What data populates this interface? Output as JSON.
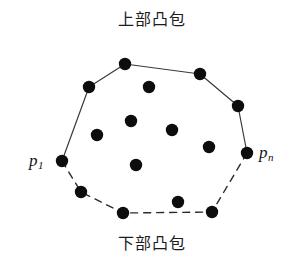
{
  "figure": {
    "title_top": "上部凸包",
    "title_bottom": "下部凸包",
    "label_p1_base": "p",
    "label_p1_sub": "1",
    "label_pn_base": "p",
    "label_pn_sub": "n",
    "colors": {
      "point_fill": "#0d0d0d",
      "hull_solid": "#3a3a3a",
      "hull_dashed": "#2b2b2b",
      "background": "#ffffff",
      "text": "#1c1c1c"
    },
    "point_radius": 6.2,
    "solid_stroke_width": 1.2,
    "dashed_stroke_width": 1.4,
    "dash_pattern": "7 6"
  },
  "chart_data": {
    "type": "scatter",
    "xlabel": "",
    "ylabel": "",
    "xlim": [
      0,
      303
    ],
    "ylim": [
      273,
      0
    ],
    "grid": false,
    "legend": "none",
    "annotations": [
      {
        "text": "上部凸包",
        "x": 151,
        "y": 20,
        "role": "upper-hull-caption"
      },
      {
        "text": "下部凸包",
        "x": 151,
        "y": 244,
        "role": "lower-hull-caption"
      },
      {
        "text": "p1",
        "x": 38,
        "y": 160,
        "role": "leftmost-vertex-label"
      },
      {
        "text": "pn",
        "x": 267,
        "y": 152,
        "role": "rightmost-vertex-label"
      }
    ],
    "hull_upper_chain": [
      {
        "name": "p1",
        "x": 62,
        "y": 161
      },
      {
        "name": "u1",
        "x": 89,
        "y": 87
      },
      {
        "name": "u2",
        "x": 125,
        "y": 64
      },
      {
        "name": "u3",
        "x": 200,
        "y": 74
      },
      {
        "name": "u4",
        "x": 238,
        "y": 106
      },
      {
        "name": "pn",
        "x": 247,
        "y": 153
      }
    ],
    "hull_lower_chain": [
      {
        "name": "p1",
        "x": 62,
        "y": 161
      },
      {
        "name": "l1",
        "x": 81,
        "y": 192
      },
      {
        "name": "l2",
        "x": 123,
        "y": 213
      },
      {
        "name": "l3",
        "x": 212,
        "y": 212
      },
      {
        "name": "pn",
        "x": 247,
        "y": 153
      }
    ],
    "interior_points": [
      {
        "name": "i1",
        "x": 149,
        "y": 87
      },
      {
        "name": "i2",
        "x": 131,
        "y": 121
      },
      {
        "name": "i3",
        "x": 97,
        "y": 135
      },
      {
        "name": "i4",
        "x": 172,
        "y": 130
      },
      {
        "name": "i5",
        "x": 209,
        "y": 147
      },
      {
        "name": "i6",
        "x": 136,
        "y": 165
      },
      {
        "name": "i7",
        "x": 178,
        "y": 202
      }
    ]
  }
}
